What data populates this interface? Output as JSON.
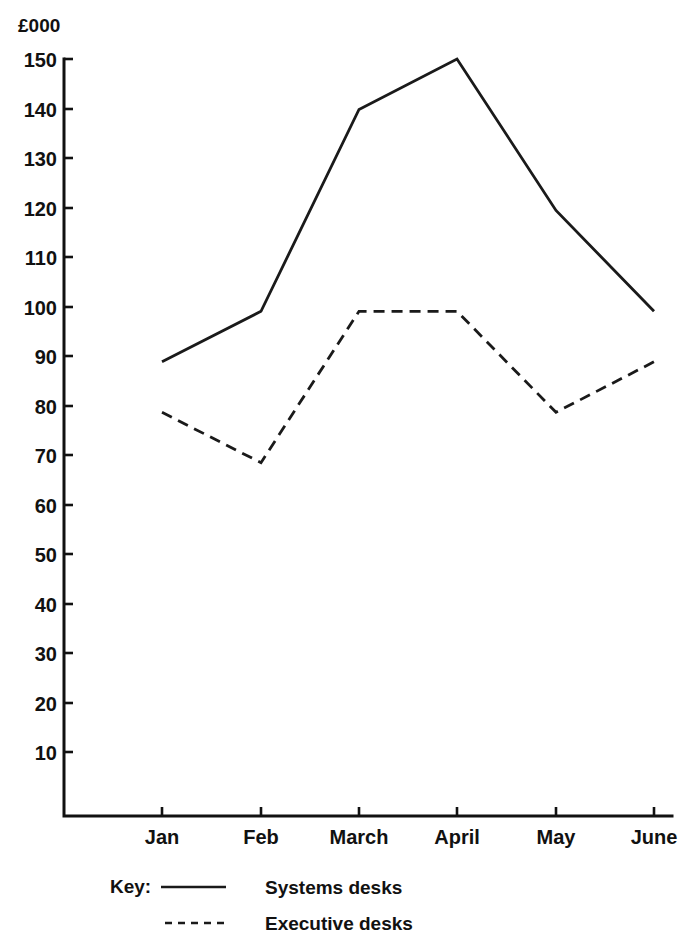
{
  "chart_data": {
    "type": "line",
    "title": "",
    "subtitle": "",
    "xlabel": "",
    "ylabel": "£000",
    "unit_label": "£000",
    "categories": [
      "Jan",
      "Feb",
      "March",
      "April",
      "May",
      "June"
    ],
    "x": [
      "Jan",
      "Feb",
      "March",
      "April",
      "May",
      "June"
    ],
    "series": [
      {
        "name": "Systems desks",
        "style": "solid",
        "color": "#1a1a1a",
        "values": [
          90,
          100,
          140,
          150,
          120,
          100
        ]
      },
      {
        "name": "Executive desks",
        "style": "dashed",
        "color": "#1a1a1a",
        "values": [
          80,
          70,
          100,
          100,
          80,
          90
        ]
      }
    ],
    "ylim": [
      0,
      150
    ],
    "yticks": [
      150,
      140,
      130,
      120,
      110,
      100,
      90,
      80,
      70,
      60,
      50,
      40,
      30,
      20,
      10
    ],
    "ytick_labels": [
      "150",
      "140",
      "130",
      "120",
      "110",
      "100",
      "90",
      "80",
      "70",
      "60",
      "50",
      "40",
      "30",
      "20",
      "10"
    ],
    "grid": false,
    "legend_position": "bottom-left"
  },
  "axes": {
    "y_unit": "£000",
    "y_labels": [
      "150",
      "140",
      "130",
      "120",
      "110",
      "100",
      "90",
      "80",
      "70",
      "60",
      "50",
      "40",
      "30",
      "20",
      "10"
    ],
    "x_labels": [
      "Jan",
      "Feb",
      "March",
      "April",
      "May",
      "June"
    ]
  },
  "legend": {
    "key_label": "Key:",
    "entries": [
      {
        "label": "Systems desks",
        "style": "solid"
      },
      {
        "label": "Executive desks",
        "style": "dashed"
      }
    ]
  }
}
